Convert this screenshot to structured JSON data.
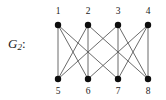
{
  "figure": {
    "label_main": "G",
    "label_sub": "2",
    "label_colon": ":",
    "width": 166,
    "height": 100
  },
  "style": {
    "edge_color": "#5a5a5a",
    "node_color": "#0d0d0d",
    "label_color": "#1a1a1a",
    "background": "#ffffff",
    "node_radius": 3.2,
    "edge_width": 0.9
  },
  "chart_data": {
    "type": "diagram",
    "subtype": "bipartite-graph",
    "vertex_count": 8,
    "edge_count": 12,
    "nodes": [
      {
        "id": "1",
        "label": "1",
        "x": 58,
        "y": 25,
        "row": "top",
        "label_x": 58,
        "label_y": 14
      },
      {
        "id": "2",
        "label": "2",
        "x": 88,
        "y": 25,
        "row": "top",
        "label_x": 88,
        "label_y": 14
      },
      {
        "id": "3",
        "label": "3",
        "x": 118,
        "y": 25,
        "row": "top",
        "label_x": 118,
        "label_y": 14
      },
      {
        "id": "4",
        "label": "4",
        "x": 148,
        "y": 25,
        "row": "top",
        "label_x": 148,
        "label_y": 14
      },
      {
        "id": "5",
        "label": "5",
        "x": 58,
        "y": 79,
        "row": "bottom",
        "label_x": 58,
        "label_y": 94
      },
      {
        "id": "6",
        "label": "6",
        "x": 88,
        "y": 79,
        "row": "bottom",
        "label_x": 88,
        "label_y": 94
      },
      {
        "id": "7",
        "label": "7",
        "x": 118,
        "y": 79,
        "row": "bottom",
        "label_x": 118,
        "label_y": 94
      },
      {
        "id": "8",
        "label": "8",
        "x": 148,
        "y": 79,
        "row": "bottom",
        "label_x": 148,
        "label_y": 94
      }
    ],
    "edges": [
      {
        "from": "1",
        "to": "5",
        "x1": 58,
        "y1": 25,
        "x2": 58,
        "y2": 79
      },
      {
        "from": "1",
        "to": "6",
        "x1": 58,
        "y1": 25,
        "x2": 88,
        "y2": 79
      },
      {
        "from": "1",
        "to": "7",
        "x1": 58,
        "y1": 25,
        "x2": 118,
        "y2": 79
      },
      {
        "from": "2",
        "to": "5",
        "x1": 88,
        "y1": 25,
        "x2": 58,
        "y2": 79
      },
      {
        "from": "2",
        "to": "6",
        "x1": 88,
        "y1": 25,
        "x2": 88,
        "y2": 79
      },
      {
        "from": "2",
        "to": "8",
        "x1": 88,
        "y1": 25,
        "x2": 148,
        "y2": 79
      },
      {
        "from": "3",
        "to": "5",
        "x1": 118,
        "y1": 25,
        "x2": 58,
        "y2": 79
      },
      {
        "from": "3",
        "to": "7",
        "x1": 118,
        "y1": 25,
        "x2": 118,
        "y2": 79
      },
      {
        "from": "3",
        "to": "8",
        "x1": 118,
        "y1": 25,
        "x2": 148,
        "y2": 79
      },
      {
        "from": "4",
        "to": "6",
        "x1": 148,
        "y1": 25,
        "x2": 88,
        "y2": 79
      },
      {
        "from": "4",
        "to": "7",
        "x1": 148,
        "y1": 25,
        "x2": 118,
        "y2": 79
      },
      {
        "from": "4",
        "to": "8",
        "x1": 148,
        "y1": 25,
        "x2": 148,
        "y2": 79
      }
    ]
  }
}
